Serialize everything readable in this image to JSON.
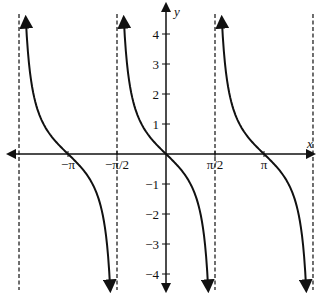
{
  "chart_data": {
    "type": "line",
    "title": "",
    "function": "y = -tan(x)",
    "xlabel": "x",
    "ylabel": "y",
    "x_tick_labels": [
      "−π",
      "−π/2",
      "π/2",
      "π"
    ],
    "x_tick_values": [
      -3.14159,
      -1.5708,
      1.5708,
      3.14159
    ],
    "y_tick_labels": [
      "4",
      "3",
      "2",
      "1",
      "−1",
      "−2",
      "−3",
      "−4"
    ],
    "y_tick_values": [
      4,
      3,
      2,
      1,
      -1,
      -2,
      -3,
      -4
    ],
    "xlim": [
      -4.9,
      4.9
    ],
    "ylim": [
      -4.6,
      4.6
    ],
    "grid": false,
    "asymptotes": [
      -4.712,
      -1.5708,
      1.5708,
      4.712
    ],
    "zeros": [
      -3.14159,
      0,
      3.14159
    ],
    "series": [
      {
        "name": "branch-1",
        "domain": [
          -4.712,
          -1.5708
        ],
        "points": [
          [
            -4.5,
            4.5
          ],
          [
            -3.93,
            1
          ],
          [
            -3.14,
            0
          ],
          [
            -2.36,
            -1
          ],
          [
            -1.79,
            -4.5
          ]
        ]
      },
      {
        "name": "branch-2",
        "domain": [
          -1.5708,
          1.5708
        ],
        "points": [
          [
            -1.35,
            4.5
          ],
          [
            -0.785,
            1
          ],
          [
            0,
            0
          ],
          [
            0.785,
            -1
          ],
          [
            1.35,
            -4.5
          ]
        ]
      },
      {
        "name": "branch-3",
        "domain": [
          1.5708,
          4.712
        ],
        "points": [
          [
            1.79,
            4.5
          ],
          [
            2.36,
            1
          ],
          [
            3.14,
            0
          ],
          [
            3.93,
            -1
          ],
          [
            4.5,
            -4.5
          ]
        ]
      }
    ],
    "colors": {
      "curve": "#111111",
      "axes": "#111111",
      "asymptote": "#222222"
    }
  }
}
